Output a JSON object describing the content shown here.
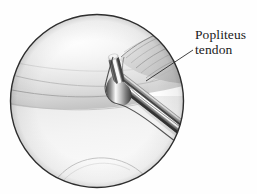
{
  "figure": {
    "kind": "arthroscopic-view-illustration",
    "background_color": "#fefefe",
    "line_color": "#2b2b2b"
  },
  "scope": {
    "label": "arthroscope circular field of view",
    "center_x": 97,
    "center_y": 101,
    "radius": 87,
    "border_color": "#2e2e2e",
    "border_width": 1.4,
    "fill_color": "#fcfcfc"
  },
  "anatomy": [
    {
      "id": "femoral-condyle",
      "name": "Femoral condyle",
      "shade": "#ececec",
      "description": "Large pale convex articular surface occupying the upper portion of the field"
    },
    {
      "id": "tibial-plateau",
      "name": "Tibial plateau",
      "shade": "#f4f4f4",
      "description": "Pale surface sweeping across the lower half of the field"
    },
    {
      "id": "lateral-meniscus",
      "name": "Lateral meniscus",
      "shade": "#e2e2e2",
      "description": "Wedge of tissue between condyle and plateau"
    },
    {
      "id": "popliteus-tendon",
      "name": "Popliteus tendon",
      "shade": "#d6d6d6",
      "description": "Striated fibrous band running obliquely at the upper right of the field"
    }
  ],
  "instrument": {
    "id": "arthroscopic-probe",
    "name": "Arthroscopic hook probe",
    "material": "stainless steel",
    "highlight_color": "#ffffff",
    "midtone_color": "#9a9a9a",
    "shadow_color": "#3c3c3c",
    "description": "Bent hook probe entering from the lower right, tip turned upward against the tendon"
  },
  "annotation": {
    "id": "popliteus-tendon-callout",
    "lines": [
      "Popliteus",
      "tendon"
    ],
    "text_color": "#1a1a1a",
    "leader": {
      "from_x": 146,
      "from_y": 81,
      "to_x": 193,
      "to_y": 50,
      "color": "#2b2b2b",
      "width": 0.9
    }
  }
}
